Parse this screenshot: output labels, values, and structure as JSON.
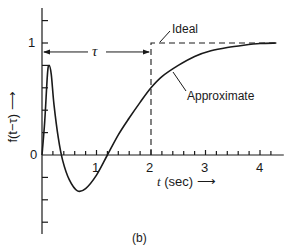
{
  "chart_data": {
    "type": "line",
    "title": "",
    "panel_label": "(b)",
    "xlabel": "t (sec)",
    "ylabel": "f(t−τ)",
    "xlim": [
      0,
      4.4
    ],
    "ylim": [
      -0.7,
      1.3
    ],
    "x_ticks": [
      0,
      1,
      2,
      3,
      4
    ],
    "x_tick_labels": [
      "0",
      "1",
      "2",
      "3",
      "4"
    ],
    "x_minor_tick_step": 0.2,
    "y_tick_labels": [
      "0",
      "1"
    ],
    "y_minor_tick_step": 0.2,
    "grid": false,
    "annotation_tau": {
      "label": "τ",
      "from": 0,
      "to": 2,
      "y": 0.92
    },
    "series": [
      {
        "name": "Ideal",
        "style": "dashed",
        "x": [
          0,
          2,
          2,
          4.4
        ],
        "y": [
          0,
          0,
          1,
          1
        ]
      },
      {
        "name": "Approximate",
        "style": "solid",
        "x": [
          0,
          0.05,
          0.1,
          0.13,
          0.17,
          0.22,
          0.3,
          0.38,
          0.5,
          0.65,
          0.8,
          1.0,
          1.2,
          1.4,
          1.6,
          1.8,
          2.0,
          2.2,
          2.5,
          2.8,
          3.1,
          3.4,
          3.7,
          4.0,
          4.3
        ],
        "y": [
          0,
          0.3,
          0.72,
          0.8,
          0.72,
          0.45,
          0.15,
          -0.05,
          -0.22,
          -0.32,
          -0.3,
          -0.18,
          0.0,
          0.18,
          0.33,
          0.47,
          0.6,
          0.7,
          0.8,
          0.88,
          0.93,
          0.96,
          0.98,
          0.995,
          1.0
        ]
      }
    ],
    "legend": [
      "Ideal",
      "Approximate"
    ],
    "legend_position": "inline callouts"
  },
  "labels": {
    "x_axis": "t",
    "x_axis_unit": "(sec)",
    "y_axis": "f(t−τ) ⟶",
    "tau": "τ",
    "ideal": "Ideal",
    "approximate": "Approximate",
    "panel": "(b)",
    "x_ticks": [
      "1",
      "2",
      "3",
      "4"
    ],
    "y_tick_0": "0",
    "y_tick_1": "1"
  }
}
